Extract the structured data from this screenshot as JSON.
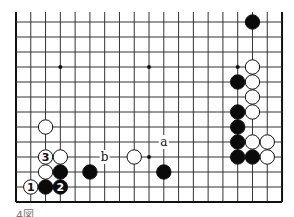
{
  "diagram": {
    "type": "go-board-fragment",
    "columns": 19,
    "rows_visible": 13,
    "open_top_edge": true,
    "grid": {
      "x0": 16,
      "dx": 14.78,
      "y0": 22,
      "dy": 15.0,
      "line_color": "#333333",
      "border_color": "#111111"
    },
    "star_points": [
      {
        "c": 3,
        "r": 3
      },
      {
        "c": 9,
        "r": 3
      },
      {
        "c": 15,
        "r": 3
      },
      {
        "c": 9,
        "r": 9
      }
    ],
    "stones": [
      {
        "color": "black",
        "c": 16,
        "r": 0
      },
      {
        "color": "white",
        "c": 16,
        "r": 3
      },
      {
        "color": "black",
        "c": 15,
        "r": 4
      },
      {
        "color": "white",
        "c": 16,
        "r": 4
      },
      {
        "color": "white",
        "c": 16,
        "r": 5
      },
      {
        "color": "black",
        "c": 15,
        "r": 6
      },
      {
        "color": "white",
        "c": 16,
        "r": 6
      },
      {
        "color": "black",
        "c": 15,
        "r": 7
      },
      {
        "color": "black",
        "c": 15,
        "r": 8
      },
      {
        "color": "white",
        "c": 16,
        "r": 8
      },
      {
        "color": "white",
        "c": 17,
        "r": 8
      },
      {
        "color": "black",
        "c": 15,
        "r": 9
      },
      {
        "color": "black",
        "c": 16,
        "r": 9
      },
      {
        "color": "white",
        "c": 17,
        "r": 9
      },
      {
        "color": "white",
        "c": 2,
        "r": 7
      },
      {
        "color": "white",
        "c": 2,
        "r": 9,
        "label": "3"
      },
      {
        "color": "white",
        "c": 3,
        "r": 9
      },
      {
        "color": "white",
        "c": 2,
        "r": 10
      },
      {
        "color": "black",
        "c": 3,
        "r": 10
      },
      {
        "color": "black",
        "c": 5,
        "r": 10
      },
      {
        "color": "white",
        "c": 1,
        "r": 11,
        "label": "1"
      },
      {
        "color": "black",
        "c": 2,
        "r": 11
      },
      {
        "color": "black",
        "c": 3,
        "r": 11,
        "label": "2"
      },
      {
        "color": "white",
        "c": 8,
        "r": 9
      },
      {
        "color": "black",
        "c": 10,
        "r": 10
      }
    ],
    "letter_marks": [
      {
        "text": "a",
        "c": 10,
        "r": 8
      },
      {
        "text": "b",
        "c": 6,
        "r": 9
      }
    ]
  },
  "caption": {
    "text": "4図"
  }
}
